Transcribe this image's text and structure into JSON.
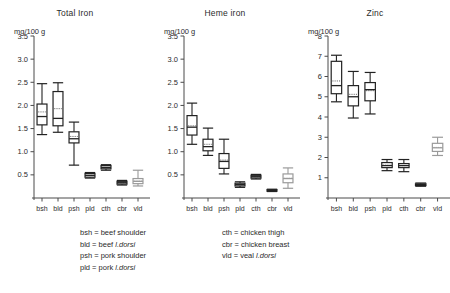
{
  "figure": {
    "axis_unit_label": "mg/100 g",
    "categories": [
      "bsh",
      "bld",
      "psh",
      "pld",
      "cth",
      "cbr",
      "vld"
    ],
    "colors": {
      "ink": "#222222",
      "gray": "#9a9a9a",
      "axis": "#4a4a4a"
    }
  },
  "legend": {
    "left_column": [
      "bsh = beef shoulder",
      "bld = beef l.dorsi",
      "psh = pork shoulder",
      "pld = pork l.dorsi"
    ],
    "right_column": [
      "cth = chicken thigh",
      "cbr = chicken breast",
      "vld = veal l.dorsi"
    ]
  },
  "chart_data": [
    {
      "type": "box",
      "title": "Total Iron",
      "ylabel": "mg/100 g",
      "xlabel": "",
      "ylim": [
        0,
        3.5
      ],
      "yticks": [
        0.5,
        1.0,
        1.5,
        2.0,
        2.5,
        3.0,
        3.5
      ],
      "ytick_labels": [
        "0.5",
        "1.0",
        "1.5",
        "2.0",
        "2.5",
        "3.0",
        "3.5"
      ],
      "grid": false,
      "categories": [
        "bsh",
        "bld",
        "psh",
        "pld",
        "cth",
        "cbr",
        "vld"
      ],
      "boxes": [
        {
          "category": "bsh",
          "min": 1.37,
          "q1": 1.58,
          "median": 1.76,
          "mean": 1.86,
          "q3": 2.03,
          "max": 2.47,
          "color": "#222222"
        },
        {
          "category": "bld",
          "min": 1.42,
          "q1": 1.56,
          "median": 1.72,
          "mean": 1.93,
          "q3": 2.3,
          "max": 2.49,
          "color": "#222222"
        },
        {
          "category": "psh",
          "min": 0.71,
          "q1": 1.19,
          "median": 1.28,
          "mean": 1.33,
          "q3": 1.43,
          "max": 1.64,
          "color": "#222222"
        },
        {
          "category": "pld",
          "min": 0.43,
          "q1": 0.45,
          "median": 0.49,
          "mean": 0.49,
          "q3": 0.53,
          "max": 0.55,
          "color": "#222222"
        },
        {
          "category": "cth",
          "min": 0.6,
          "q1": 0.63,
          "median": 0.66,
          "mean": 0.66,
          "q3": 0.7,
          "max": 0.72,
          "color": "#222222"
        },
        {
          "category": "cbr",
          "min": 0.28,
          "q1": 0.3,
          "median": 0.33,
          "mean": 0.33,
          "q3": 0.36,
          "max": 0.38,
          "color": "#222222"
        },
        {
          "category": "vld",
          "min": 0.26,
          "q1": 0.31,
          "median": 0.36,
          "mean": 0.37,
          "q3": 0.42,
          "max": 0.6,
          "color": "#9a9a9a"
        }
      ]
    },
    {
      "type": "box",
      "title": "Heme iron",
      "ylabel": "mg/100 g",
      "xlabel": "",
      "ylim": [
        0,
        3.5
      ],
      "yticks": [
        0.5,
        1.0,
        1.5,
        2.0,
        2.5,
        3.0,
        3.5
      ],
      "ytick_labels": [
        "0.5",
        "1.0",
        "1.5",
        "2.0",
        "2.5",
        "3.0",
        "3.5"
      ],
      "grid": false,
      "categories": [
        "bsh",
        "bld",
        "psh",
        "pld",
        "cth",
        "cbr",
        "vld"
      ],
      "boxes": [
        {
          "category": "bsh",
          "min": 1.16,
          "q1": 1.36,
          "median": 1.53,
          "mean": 1.56,
          "q3": 1.78,
          "max": 2.05,
          "color": "#222222"
        },
        {
          "category": "bld",
          "min": 0.92,
          "q1": 1.02,
          "median": 1.11,
          "mean": 1.16,
          "q3": 1.27,
          "max": 1.51,
          "color": "#222222"
        },
        {
          "category": "psh",
          "min": 0.52,
          "q1": 0.64,
          "median": 0.79,
          "mean": 0.82,
          "q3": 0.96,
          "max": 1.27,
          "color": "#222222"
        },
        {
          "category": "pld",
          "min": 0.23,
          "q1": 0.26,
          "median": 0.29,
          "mean": 0.29,
          "q3": 0.32,
          "max": 0.35,
          "color": "#222222"
        },
        {
          "category": "cth",
          "min": 0.41,
          "q1": 0.43,
          "median": 0.46,
          "mean": 0.46,
          "q3": 0.49,
          "max": 0.51,
          "color": "#222222"
        },
        {
          "category": "cbr",
          "min": 0.14,
          "q1": 0.15,
          "median": 0.16,
          "mean": 0.16,
          "q3": 0.18,
          "max": 0.19,
          "color": "#222222"
        },
        {
          "category": "vld",
          "min": 0.21,
          "q1": 0.33,
          "median": 0.42,
          "mean": 0.43,
          "q3": 0.52,
          "max": 0.65,
          "color": "#9a9a9a"
        }
      ]
    },
    {
      "type": "box",
      "title": "Zinc",
      "ylabel": "mg/100 g",
      "xlabel": "",
      "ylim": [
        0,
        8
      ],
      "yticks": [
        1,
        2,
        3,
        4,
        5,
        6,
        7,
        8
      ],
      "ytick_labels": [
        "1",
        "2",
        "3",
        "4",
        "5",
        "6",
        "7",
        "8"
      ],
      "grid": false,
      "categories": [
        "bsh",
        "bld",
        "psh",
        "pld",
        "cth",
        "cbr",
        "vld"
      ],
      "boxes": [
        {
          "category": "bsh",
          "min": 4.75,
          "q1": 5.15,
          "median": 5.55,
          "mean": 5.78,
          "q3": 6.75,
          "max": 7.05,
          "color": "#222222"
        },
        {
          "category": "bld",
          "min": 3.95,
          "q1": 4.55,
          "median": 5.0,
          "mean": 5.12,
          "q3": 5.55,
          "max": 6.25,
          "color": "#222222"
        },
        {
          "category": "psh",
          "min": 4.15,
          "q1": 4.8,
          "median": 5.35,
          "mean": 5.3,
          "q3": 5.7,
          "max": 6.2,
          "color": "#222222"
        },
        {
          "category": "pld",
          "min": 1.35,
          "q1": 1.5,
          "median": 1.6,
          "mean": 1.62,
          "q3": 1.75,
          "max": 1.9,
          "color": "#222222"
        },
        {
          "category": "cth",
          "min": 1.3,
          "q1": 1.5,
          "median": 1.6,
          "mean": 1.6,
          "q3": 1.7,
          "max": 1.9,
          "color": "#222222"
        },
        {
          "category": "cbr",
          "min": 0.58,
          "q1": 0.62,
          "median": 0.66,
          "mean": 0.66,
          "q3": 0.7,
          "max": 0.74,
          "color": "#222222"
        },
        {
          "category": "vld",
          "min": 2.1,
          "q1": 2.3,
          "median": 2.48,
          "mean": 2.5,
          "q3": 2.7,
          "max": 3.0,
          "color": "#9a9a9a"
        }
      ]
    }
  ]
}
